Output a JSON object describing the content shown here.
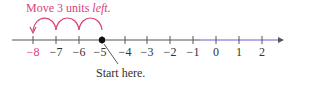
{
  "title": {
    "prefix": "Move 3 units ",
    "emphasis": "left."
  },
  "start_label": "Start here.",
  "colors": {
    "accent": "#d9437a",
    "axis": "#555555",
    "highlight": "#6b5fd0",
    "point": "#111111"
  },
  "number_line": {
    "ticks": [
      "−8",
      "−7",
      "−6",
      "−5",
      "−4",
      "−3",
      "−2",
      "−1",
      "0",
      "1",
      "2"
    ],
    "highlighted_ticks": [
      "−8"
    ],
    "start_point": -5,
    "end_point": -8,
    "jumps": 3
  }
}
